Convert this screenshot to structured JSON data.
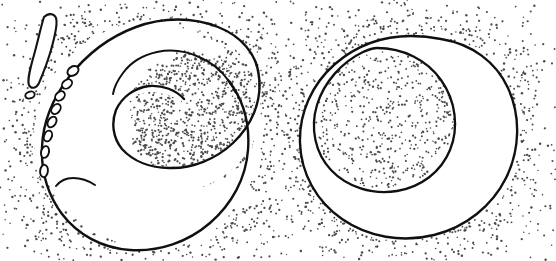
{
  "figure": {
    "caption": "",
    "background_color": "#ffffff",
    "ink_color": "#101010",
    "stipple_color": "#4a4a4a",
    "width": 556,
    "height": 261,
    "panels": [
      {
        "id": "left-panel",
        "name": "crescent-cell-with-vesicle-chain",
        "label": "",
        "description": "C-shaped crescent body opening to the left, stipple field outside the body and filling the concave bay, with a chain of small oval vesicles and an elongated sliver at the upper left",
        "elements": [
          {
            "name": "crescent-outline",
            "type": "closed-curve",
            "fill": "#ffffff",
            "stroke": "#101010"
          },
          {
            "name": "stipple-field-outer",
            "type": "stipple",
            "density": "graded"
          },
          {
            "name": "stipple-field-bay",
            "type": "stipple",
            "density": "graded"
          },
          {
            "name": "vesicle-chain",
            "type": "oval-chain",
            "count": 9
          },
          {
            "name": "elongated-sliver",
            "type": "closed-curve",
            "fill": "#ffffff"
          }
        ]
      },
      {
        "id": "right-panel",
        "name": "engulfed-vacuole-cell",
        "label": "",
        "description": "Large closed round body with stipple outside it, containing an internal rounded vacuole whose interior is stippled; the vacuole wall runs close to the outer wall at the upper left",
        "elements": [
          {
            "name": "outer-outline",
            "type": "closed-curve",
            "fill": "#ffffff",
            "stroke": "#101010"
          },
          {
            "name": "inner-vacuole-outline",
            "type": "closed-curve",
            "fill": "#ffffff",
            "stroke": "#101010"
          },
          {
            "name": "stipple-field-outer",
            "type": "stipple",
            "density": "graded"
          },
          {
            "name": "stipple-field-vacuole",
            "type": "stipple",
            "density": "uniform"
          }
        ]
      }
    ]
  },
  "chart_data": {
    "type": "diagram",
    "panels": [
      "crescent-cell-with-vesicle-chain",
      "engulfed-vacuole-cell"
    ],
    "xlabel": "",
    "ylabel": ""
  }
}
